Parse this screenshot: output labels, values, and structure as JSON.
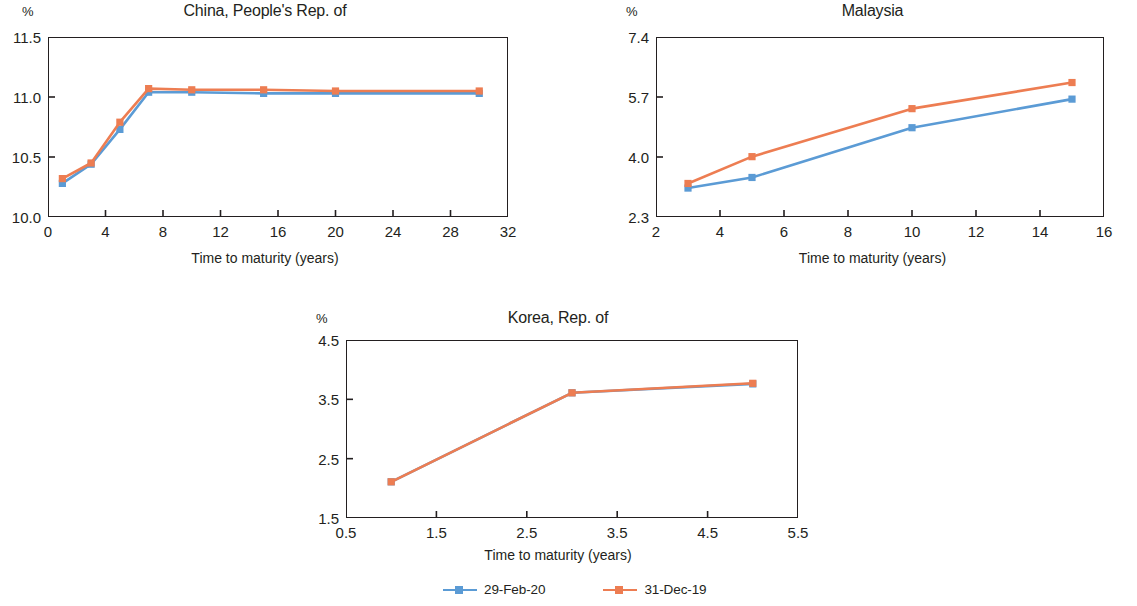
{
  "figure": {
    "unit_label": "%",
    "xlabel": "Time to maturity (years)",
    "colors": {
      "series_1": "#5b9bd5",
      "series_2": "#ed7d52"
    }
  },
  "legend": {
    "position": "bottom-center",
    "entries": [
      {
        "label": "29-Feb-20",
        "color": "#5b9bd5",
        "marker": "square"
      },
      {
        "label": "31-Dec-19",
        "color": "#ed7d52",
        "marker": "square"
      }
    ]
  },
  "chart_data": [
    {
      "type": "line",
      "title": "China, People's Rep. of",
      "xlabel": "Time to maturity (years)",
      "ylabel": "%",
      "xlim": [
        0,
        32
      ],
      "ylim": [
        10.0,
        11.5
      ],
      "xticks": [
        0,
        4,
        8,
        12,
        16,
        20,
        24,
        28,
        32
      ],
      "xtick_labels": [
        "0",
        "4",
        "8",
        "12",
        "16",
        "20",
        "24",
        "28",
        "32"
      ],
      "yticks": [
        10.0,
        10.5,
        11.0,
        11.5
      ],
      "ytick_labels": [
        "10.0",
        "10.5",
        "11.0",
        "11.5"
      ],
      "grid": false,
      "x": [
        1,
        3,
        5,
        7,
        10,
        15,
        20,
        30
      ],
      "series": [
        {
          "name": "29-Feb-20",
          "color": "#5b9bd5",
          "values": [
            10.28,
            10.44,
            10.73,
            11.04,
            11.04,
            11.03,
            11.03,
            11.03
          ]
        },
        {
          "name": "31-Dec-19",
          "color": "#ed7d52",
          "values": [
            10.32,
            10.45,
            10.79,
            11.07,
            11.06,
            11.06,
            11.05,
            11.05
          ]
        }
      ]
    },
    {
      "type": "line",
      "title": "Malaysia",
      "xlabel": "Time to maturity (years)",
      "ylabel": "%",
      "xlim": [
        2,
        16
      ],
      "ylim": [
        2.3,
        7.4
      ],
      "xticks": [
        2,
        4,
        6,
        8,
        10,
        12,
        14,
        16
      ],
      "xtick_labels": [
        "2",
        "4",
        "6",
        "8",
        "10",
        "12",
        "14",
        "16"
      ],
      "yticks": [
        2.3,
        4.0,
        5.7,
        7.4
      ],
      "ytick_labels": [
        "2.3",
        "4.0",
        "5.7",
        "7.4"
      ],
      "grid": false,
      "x": [
        3,
        5,
        10,
        15
      ],
      "series": [
        {
          "name": "29-Feb-20",
          "color": "#5b9bd5",
          "values": [
            3.12,
            3.42,
            4.83,
            5.64
          ]
        },
        {
          "name": "31-Dec-19",
          "color": "#ed7d52",
          "values": [
            3.25,
            4.01,
            5.37,
            6.11
          ]
        }
      ]
    },
    {
      "type": "line",
      "title": "Korea, Rep. of",
      "xlabel": "Time to maturity (years)",
      "ylabel": "%",
      "xlim": [
        0.5,
        5.5
      ],
      "ylim": [
        1.5,
        4.5
      ],
      "xticks": [
        0.5,
        1.5,
        2.5,
        3.5,
        4.5,
        5.5
      ],
      "xtick_labels": [
        "0.5",
        "1.5",
        "2.5",
        "3.5",
        "4.5",
        "5.5"
      ],
      "yticks": [
        1.5,
        2.5,
        3.5,
        4.5
      ],
      "ytick_labels": [
        "1.5",
        "2.5",
        "3.5",
        "4.5"
      ],
      "grid": false,
      "x": [
        1,
        3,
        5
      ],
      "series": [
        {
          "name": "29-Feb-20",
          "color": "#5b9bd5",
          "values": [
            2.11,
            3.61,
            3.76
          ]
        },
        {
          "name": "31-Dec-19",
          "color": "#ed7d52",
          "values": [
            2.11,
            3.61,
            3.77
          ]
        }
      ]
    }
  ]
}
